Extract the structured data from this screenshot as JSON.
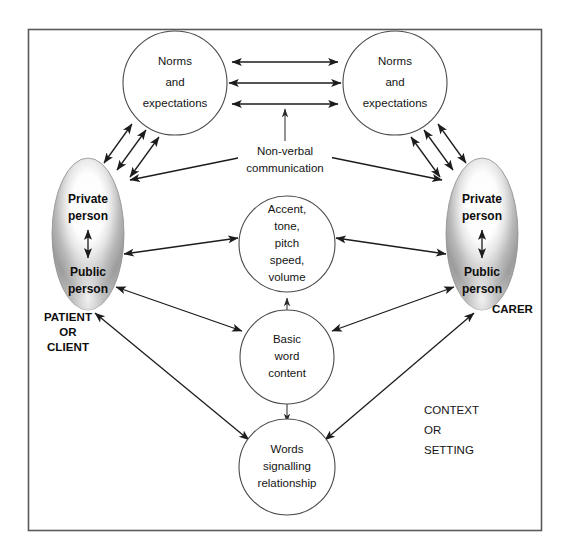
{
  "figure": {
    "kind": "communication-model-diagram",
    "frame": {
      "x": 28,
      "y": 29,
      "width": 514,
      "height": 502
    },
    "colors": {
      "frame_stroke": "#5a5a5a",
      "circle_stroke": "#4a4a4a",
      "circle_fill": "#ffffff",
      "ellipse_outer": "#9d9d9d",
      "ellipse_inner": "#ffffff",
      "arrow": "#1c1c1c",
      "text": "#141414",
      "background": "#ffffff"
    }
  },
  "nodes": {
    "norms_left": {
      "name": "Norms and expectations (left)",
      "lines": [
        "Norms",
        "and",
        "expectations"
      ],
      "shape": "circle",
      "cx": 175,
      "cy": 83,
      "r": 52
    },
    "norms_right": {
      "name": "Norms and expectations (right)",
      "lines": [
        "Norms",
        "and",
        "expectations"
      ],
      "shape": "circle",
      "cx": 395,
      "cy": 83,
      "r": 52
    },
    "person_left": {
      "name": "Patient or client person",
      "top_lines": [
        "Private",
        "person"
      ],
      "bottom_lines": [
        "Public",
        "person"
      ],
      "shape": "ellipse",
      "cx": 88,
      "cy": 234,
      "rx": 36,
      "ry": 76,
      "caption": [
        "PATIENT",
        "OR",
        "CLIENT"
      ],
      "caption_x": 68,
      "caption_y": 318
    },
    "person_right": {
      "name": "Carer person",
      "top_lines": [
        "Private",
        "person"
      ],
      "bottom_lines": [
        "Public",
        "person"
      ],
      "shape": "ellipse",
      "cx": 482,
      "cy": 234,
      "rx": 36,
      "ry": 76,
      "caption": [
        "CARER"
      ],
      "caption_x": 494,
      "caption_y": 310
    },
    "accent": {
      "name": "Accent tone pitch speed volume",
      "lines": [
        "Accent,",
        "tone,",
        "pitch",
        "speed,",
        "volume"
      ],
      "shape": "circle",
      "cx": 287,
      "cy": 244,
      "r": 48
    },
    "basic_word": {
      "name": "Basic word content",
      "lines": [
        "Basic",
        "word",
        "content"
      ],
      "shape": "circle",
      "cx": 287,
      "cy": 357,
      "r": 47
    },
    "words_rel": {
      "name": "Words signalling relationship",
      "lines": [
        "Words",
        "signalling",
        "relationship"
      ],
      "shape": "circle",
      "cx": 287,
      "cy": 467,
      "r": 48
    }
  },
  "edge_labels": {
    "non_verbal": {
      "name": "Non-verbal communication",
      "lines": [
        "Non-verbal",
        "communication"
      ],
      "x": 285,
      "y": 152
    }
  },
  "annotations": {
    "context_setting": {
      "name": "Context or setting",
      "lines": [
        "CONTEXT",
        "OR",
        "SETTING"
      ],
      "x": 424,
      "y": 411
    }
  },
  "edges": [
    {
      "from": "norms_left",
      "to": "norms_right",
      "style": "double-arrow",
      "count": 3,
      "orientation": "horizontal"
    },
    {
      "from": "non_verbal",
      "to": "norms_arrows",
      "style": "single-arrow",
      "orientation": "vertical-up"
    },
    {
      "from": "norms_left",
      "to": "person_left",
      "style": "double-arrow",
      "count": 3,
      "orientation": "diagonal"
    },
    {
      "from": "norms_right",
      "to": "person_right",
      "style": "double-arrow",
      "count": 3,
      "orientation": "diagonal"
    },
    {
      "from": "non_verbal",
      "to": "person_left",
      "style": "single-arrow",
      "orientation": "diagonal"
    },
    {
      "from": "non_verbal",
      "to": "person_right",
      "style": "single-arrow",
      "orientation": "diagonal"
    },
    {
      "from": "person_left",
      "to": "accent",
      "style": "double-arrow"
    },
    {
      "from": "person_right",
      "to": "accent",
      "style": "double-arrow"
    },
    {
      "from": "person_left",
      "to": "basic_word",
      "style": "double-arrow"
    },
    {
      "from": "person_right",
      "to": "basic_word",
      "style": "double-arrow"
    },
    {
      "from": "person_left",
      "to": "words_rel",
      "style": "double-arrow"
    },
    {
      "from": "person_right",
      "to": "words_rel",
      "style": "double-arrow"
    },
    {
      "from": "accent",
      "to": "basic_word",
      "style": "double-arrow",
      "orientation": "vertical"
    },
    {
      "from": "basic_word",
      "to": "words_rel",
      "style": "double-arrow",
      "orientation": "vertical"
    },
    {
      "from": "person_left",
      "to": "person_left_inner",
      "style": "double-arrow",
      "orientation": "vertical"
    },
    {
      "from": "person_right",
      "to": "person_right_inner",
      "style": "double-arrow",
      "orientation": "vertical"
    }
  ]
}
